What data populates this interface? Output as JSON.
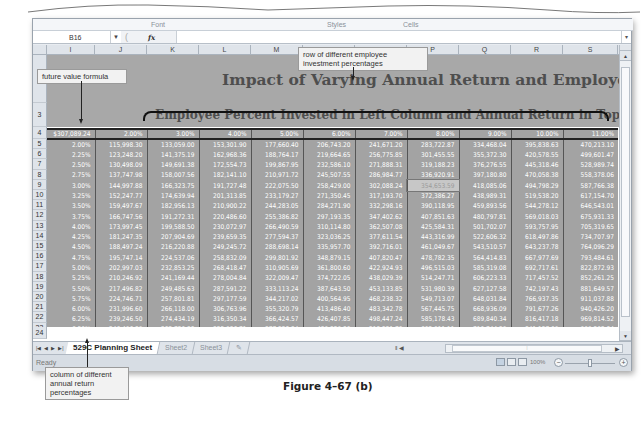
{
  "ribbon": {
    "groups": [
      "Font",
      "Styles",
      "Cells"
    ]
  },
  "formula_bar": {
    "name_box": "B16",
    "fx_label": "fx",
    "formula": ""
  },
  "columns": [
    "I",
    "J",
    "K",
    "L",
    "M",
    "N",
    "O",
    "P",
    "Q",
    "R",
    "S"
  ],
  "rows": {
    "title_row_label": "",
    "subtitle_row_label": "3",
    "header_row_label": "4",
    "data_row_labels": [
      "5",
      "6",
      "7",
      "8",
      "9",
      "10",
      "11",
      "12",
      "13",
      "14",
      "15",
      "16",
      "17",
      "18",
      "19",
      "20",
      "21",
      "22",
      "23"
    ],
    "empty_row_label": "24"
  },
  "sheet": {
    "title": "Impact of Varying Annual Return and Employee Percent Invested",
    "subtitle": "Employee Percent Invested in Left Column and Annual Return in Top Row",
    "corner_value": "$307,089.24",
    "annual_returns": [
      "2.00%",
      "3.00%",
      "4.00%",
      "5.00%",
      "6.00%",
      "7.00%",
      "8.00%",
      "9.00%",
      "10.00%",
      "11.00%"
    ],
    "selected_cell": {
      "row": 4,
      "col": 6,
      "value": "302,088.24"
    },
    "table": [
      {
        "pct": "2.00%",
        "values": [
          "115,998.30",
          "133,059.00",
          "153,301.90",
          "177,660.40",
          "206,743.20",
          "241,671.20",
          "283,722.87",
          "334,468.04",
          "395,838.63",
          "470,213.10"
        ]
      },
      {
        "pct": "2.25%",
        "values": [
          "123,248.20",
          "141,375.19",
          "162,968.36",
          "188,764.17",
          "219,664.65",
          "256,775.85",
          "301,455.55",
          "355,372.30",
          "420,578.55",
          "499,601.47"
        ]
      },
      {
        "pct": "2.50%",
        "values": [
          "130,498.09",
          "149,691.38",
          "172,554.73",
          "199,867.95",
          "232,586.10",
          "271,888.31",
          "319,188.23",
          "376,276.55",
          "445,318.46",
          "528,989.74"
        ]
      },
      {
        "pct": "2.75%",
        "values": [
          "137,747.98",
          "158,007.56",
          "182,141.10",
          "210,971.72",
          "245,507.55",
          "286,984.77",
          "336,920.91",
          "397,180.80",
          "470,058.38",
          "558,378.06"
        ]
      },
      {
        "pct": "3.00%",
        "values": [
          "144,997.88",
          "166,323.75",
          "191,727.48",
          "222,075.50",
          "258,429.00",
          "302,088.24",
          "354,653.59",
          "418,085.06",
          "494,798.29",
          "587,766.38"
        ]
      },
      {
        "pct": "3.25%",
        "values": [
          "152,247.77",
          "174,639.94",
          "201,313.85",
          "233,179.27",
          "271,350.45",
          "317,193.70",
          "372,386.27",
          "438,989.31",
          "519,538.20",
          "617,154.70"
        ]
      },
      {
        "pct": "3.50%",
        "values": [
          "159,497.67",
          "182,956.13",
          "210,900.22",
          "244,283.05",
          "284,271.90",
          "332,298.16",
          "390,118.95",
          "459,893.56",
          "544,278.12",
          "646,543.01"
        ]
      },
      {
        "pct": "3.75%",
        "values": [
          "166,747.56",
          "191,272.31",
          "220,486.60",
          "255,386.82",
          "297,193.35",
          "347,402.62",
          "407,851.63",
          "480,797.81",
          "569,018.03",
          "675,931.33"
        ]
      },
      {
        "pct": "4.00%",
        "values": [
          "173,997.45",
          "199,588.50",
          "230,072.97",
          "266,490.59",
          "310,114.80",
          "362,507.08",
          "425,584.31",
          "501,702.07",
          "593,757.95",
          "705,319.65"
        ]
      },
      {
        "pct": "4.25%",
        "values": [
          "181,247.35",
          "207,904.69",
          "239,659.35",
          "277,594.37",
          "323,036.25",
          "377,611.54",
          "443,316.99",
          "522,606.32",
          "618,497.86",
          "734,707.97"
        ]
      },
      {
        "pct": "4.50%",
        "values": [
          "188,497.24",
          "216,220.88",
          "249,245.72",
          "288,698.14",
          "335,957.70",
          "392,716.01",
          "461,049.67",
          "543,510.57",
          "643,237.78",
          "764,096.29"
        ]
      },
      {
        "pct": "4.75%",
        "values": [
          "195,747.14",
          "224,537.06",
          "258,832.09",
          "299,801.92",
          "348,879.15",
          "407,820.47",
          "478,782.35",
          "564,414.83",
          "667,977.69",
          "793,484.61"
        ]
      },
      {
        "pct": "5.00%",
        "values": [
          "202,997.03",
          "232,853.25",
          "268,418.47",
          "310,905.69",
          "361,800.60",
          "422,924.93",
          "496,515.03",
          "585,319.08",
          "692,717.61",
          "822,872.93"
        ]
      },
      {
        "pct": "5.25%",
        "values": [
          "210,246.92",
          "241,169.44",
          "278,004.84",
          "322,009.47",
          "374,722.05",
          "438,029.39",
          "514,247.71",
          "606,223.33",
          "717,457.52",
          "852,261.25"
        ]
      },
      {
        "pct": "5.50%",
        "values": [
          "217,496.82",
          "249,485.63",
          "287,591.22",
          "333,113.24",
          "387,643.50",
          "453,133.85",
          "531,980.39",
          "627,127.58",
          "742,197.43",
          "881,649.57"
        ]
      },
      {
        "pct": "5.75%",
        "values": [
          "224,746.71",
          "257,801.81",
          "297,177.59",
          "344,217.02",
          "400,564.95",
          "468,238.32",
          "549,713.07",
          "648,031.84",
          "766,937.35",
          "911,037.88"
        ]
      },
      {
        "pct": "6.00%",
        "values": [
          "231,996.60",
          "266,118.00",
          "306,763.96",
          "355,320.79",
          "413,486.40",
          "483,342.78",
          "567,445.75",
          "668,936.09",
          "791,677.26",
          "940,426.20"
        ]
      },
      {
        "pct": "6.25%",
        "values": [
          "239,246.50",
          "274,434.19",
          "316,350.34",
          "366,424.57",
          "426,407.85",
          "498,447.24",
          "585,178.43",
          "689,840.34",
          "816,417.18",
          "969,814.52"
        ]
      },
      {
        "pct": "6.50%",
        "values": [
          "246,496.39",
          "282,750.38",
          "325,936.71",
          "377,528.34",
          "439,329.30",
          "513,551.70",
          "602,911.11",
          "710,744.59",
          "841,157.09",
          "999,202.84"
        ]
      }
    ]
  },
  "sheet_tabs": {
    "tabs": [
      "529C Planning Sheet",
      "Sheet2",
      "Sheet3"
    ],
    "active": "529C Planning Sheet"
  },
  "status_bar": {
    "status": "Ready",
    "zoom_level": "100%"
  },
  "callouts": {
    "future_value": "future value formula",
    "row_percentages": "row of different employee investment percentages",
    "column_returns": "column of different annual return percentages"
  },
  "caption": "Figure 4–67 (b)"
}
